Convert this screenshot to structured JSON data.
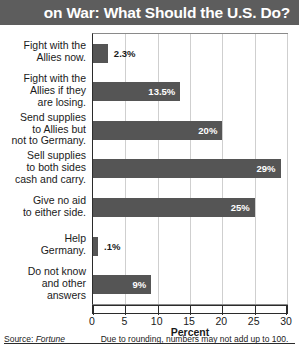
{
  "title": "on War: What Should the U.S. Do?",
  "source_prefix": "Source: ",
  "source_name": "Fortune",
  "footnote": "Due to rounding, numbers may not add up to 100.",
  "colors": {
    "title_band": "#5d5d5d",
    "bar": "#555555",
    "gridline": "#cfcfcf",
    "axis": "#2b2b2b",
    "plot_background": "#ffffff"
  },
  "chart_data": {
    "type": "bar",
    "orientation": "horizontal",
    "title": "on War: What Should the U.S. Do?",
    "xlabel": "Percent",
    "ylabel": "",
    "xlim": [
      0,
      30
    ],
    "xticks": [
      0,
      5,
      10,
      15,
      20,
      25,
      30
    ],
    "xtick_labels": [
      "0",
      "5",
      "10",
      "15",
      "20",
      "25",
      "30"
    ],
    "grid": true,
    "legend": false,
    "categories": [
      "Fight with the Allies now.",
      "Fight with the Allies if they are losing.",
      "Send supplies to Allies but not to Germany.",
      "Sell supplies to both sides cash and carry.",
      "Give no aid to either side.",
      "Help Germany.",
      "Do not know and other answers"
    ],
    "values": [
      2.3,
      13.5,
      20,
      29,
      25,
      0.1,
      9
    ],
    "data_labels": [
      "2.3%",
      "13.5%",
      "20%",
      "29%",
      "25%",
      ".1%",
      "9%"
    ],
    "label_placement": [
      "outside",
      "inside",
      "inside",
      "inside",
      "inside",
      "outside",
      "inside"
    ],
    "annotation": "Due to rounding, numbers may not add up to 100.",
    "source": "Source: Fortune"
  },
  "rows": [
    {
      "label_lines": [
        "Fight with the",
        "Allies now."
      ],
      "value": 2.3,
      "label": "2.3%",
      "placement": "outside"
    },
    {
      "label_lines": [
        "Fight with the",
        "Allies if they",
        "are losing."
      ],
      "value": 13.5,
      "label": "13.5%",
      "placement": "inside"
    },
    {
      "label_lines": [
        "Send supplies",
        "to Allies but",
        "not to Germany."
      ],
      "value": 20,
      "label": "20%",
      "placement": "inside"
    },
    {
      "label_lines": [
        "Sell supplies",
        "to both sides",
        "cash and carry."
      ],
      "value": 29,
      "label": "29%",
      "placement": "inside"
    },
    {
      "label_lines": [
        "Give no aid",
        "to either side."
      ],
      "value": 25,
      "label": "25%",
      "placement": "inside"
    },
    {
      "label_lines": [
        "Help",
        "Germany."
      ],
      "value": 0.1,
      "label": ".1%",
      "placement": "outside"
    },
    {
      "label_lines": [
        "Do not know",
        "and other",
        "answers"
      ],
      "value": 9,
      "label": "9%",
      "placement": "inside"
    }
  ]
}
